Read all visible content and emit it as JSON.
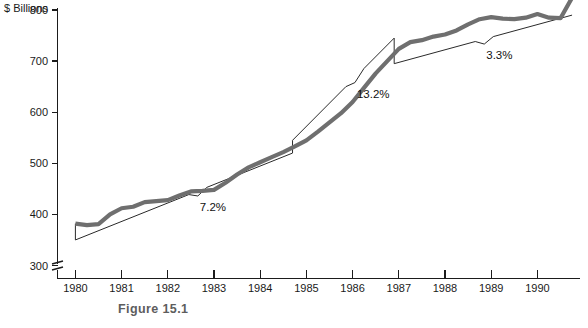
{
  "figure": {
    "caption": "Figure 15.1"
  },
  "chart_data": {
    "type": "line",
    "title": "",
    "subtitle": "",
    "xlabel": "",
    "ylabel": "$ Billions",
    "ylim": [
      300,
      830
    ],
    "xlim": [
      1979.6,
      1991.0
    ],
    "grid": false,
    "legend_position": "none",
    "axis_break": true,
    "axis_break_note": "y-axis broken below 300",
    "y_ticks": [
      300,
      400,
      500,
      600,
      700,
      800
    ],
    "y_tick_labels": [
      "300",
      "400",
      "500",
      "600",
      "700",
      "800"
    ],
    "x_ticks": [
      1980,
      1981,
      1982,
      1983,
      1984,
      1985,
      1986,
      1987,
      1988,
      1989,
      1990
    ],
    "x_tick_labels": [
      "1980",
      "1981",
      "1982",
      "1983",
      "1984",
      "1985",
      "1986",
      "1987",
      "1988",
      "1989",
      "1990"
    ],
    "series": [
      {
        "name": "Actual level",
        "style": "thick-gray",
        "x": [
          1980.0,
          1980.25,
          1980.5,
          1980.75,
          1981.0,
          1981.25,
          1981.5,
          1981.75,
          1982.0,
          1982.25,
          1982.5,
          1982.75,
          1983.0,
          1983.25,
          1983.5,
          1983.75,
          1984.0,
          1984.25,
          1984.5,
          1984.75,
          1985.0,
          1985.25,
          1985.5,
          1985.75,
          1986.0,
          1986.25,
          1986.5,
          1986.75,
          1987.0,
          1987.25,
          1987.5,
          1987.75,
          1988.0,
          1988.25,
          1988.5,
          1988.75,
          1989.0,
          1989.25,
          1989.5,
          1989.75,
          1990.0,
          1990.25,
          1990.5,
          1990.75
        ],
        "values": [
          382,
          379,
          381,
          400,
          412,
          415,
          424,
          426,
          428,
          437,
          445,
          446,
          448,
          462,
          478,
          492,
          502,
          512,
          522,
          533,
          545,
          562,
          580,
          598,
          620,
          648,
          676,
          700,
          724,
          737,
          741,
          748,
          752,
          760,
          772,
          782,
          786,
          783,
          782,
          785,
          792,
          785,
          784,
          824
        ]
      },
      {
        "name": "Trend segment 1",
        "style": "thin-black",
        "growth_rate": "7.2%",
        "x_start": 1980.0,
        "x_end": 1984.7,
        "y_start": 350,
        "y_end": 520
      },
      {
        "name": "Trend segment 2",
        "style": "thin-black",
        "growth_rate": "13.2%",
        "x_start": 1984.7,
        "x_end": 1986.9,
        "y_start": 545,
        "y_end": 745
      },
      {
        "name": "Trend segment 3",
        "style": "thin-black",
        "growth_rate": "3.3%",
        "x_start": 1986.9,
        "x_end": 1990.75,
        "y_start": 695,
        "y_end": 790
      }
    ],
    "annotations": [
      {
        "text": "7.2%",
        "x": 1982.65,
        "y": 420
      },
      {
        "text": "13.2%",
        "x": 1986.05,
        "y": 590
      },
      {
        "text": "3.3%",
        "x": 1988.85,
        "y": 715
      }
    ]
  }
}
